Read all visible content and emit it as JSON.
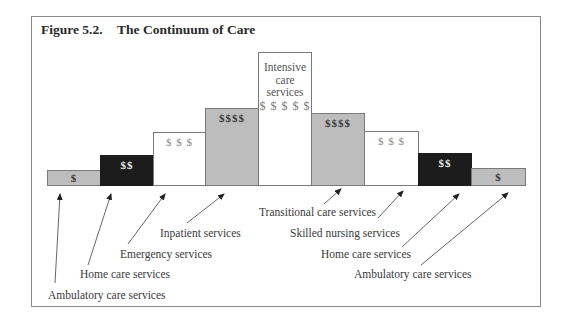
{
  "figure": {
    "number": "Figure 5.2.",
    "title": "The Continuum of Care"
  },
  "bars": [
    {
      "id": "ambulatory-left",
      "cost": "$",
      "fill": "gray"
    },
    {
      "id": "home-care-left",
      "cost": "$$",
      "fill": "black"
    },
    {
      "id": "emergency",
      "cost": "$ $ $",
      "fill": "white"
    },
    {
      "id": "inpatient",
      "cost": "$$$$",
      "fill": "gray"
    },
    {
      "id": "intensive-care",
      "line1": "Intensive",
      "line2": "care",
      "line3": "services",
      "cost": "$ $ $ $ $",
      "fill": "white"
    },
    {
      "id": "transitional",
      "cost": "$$$$",
      "fill": "gray"
    },
    {
      "id": "skilled-nursing",
      "cost": "$ $ $",
      "fill": "white"
    },
    {
      "id": "home-care-right",
      "cost": "$$",
      "fill": "black"
    },
    {
      "id": "ambulatory-right",
      "cost": "$",
      "fill": "gray"
    }
  ],
  "labels": {
    "ambulatory_left": "Ambulatory care services",
    "home_care_left": "Home care services",
    "emergency": "Emergency services",
    "inpatient": "Inpatient services",
    "transitional": "Transitional care services",
    "skilled_nursing": "Skilled nursing services",
    "home_care_right": "Home care services",
    "ambulatory_right": "Ambulatory care services"
  },
  "colors": {
    "gray_fill": "#bdbdbd",
    "black_fill": "#1c1c1c",
    "white_fill": "#ffffff",
    "border": "#8a8a8a"
  }
}
